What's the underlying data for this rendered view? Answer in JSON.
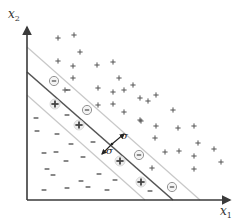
{
  "diagram": {
    "axes": {
      "x_label": "x",
      "x_sub": "1",
      "y_label": "x",
      "y_sub": "2"
    },
    "margin_label": "σ",
    "colors": {
      "axis": "#3a3a3a",
      "boundary": "#555555",
      "margin_line": "#c8c8c8",
      "marker": "#555555",
      "support_circle": "#888888"
    },
    "lines": {
      "upper_margin": {
        "x1": 27,
        "y1": 47,
        "x2": 200,
        "y2": 200
      },
      "boundary": {
        "x1": 27,
        "y1": 72,
        "x2": 173,
        "y2": 200
      },
      "lower_margin": {
        "x1": 27,
        "y1": 95,
        "x2": 145,
        "y2": 200
      }
    },
    "sigma_arrow": {
      "center": [
        112,
        144
      ],
      "upper_tip": [
        124,
        134
      ],
      "lower_tip": [
        102,
        154
      ],
      "label_upper": [
        120,
        138
      ],
      "label_lower": [
        106,
        149
      ]
    },
    "plus_points": [
      [
        58,
        38
      ],
      [
        74,
        35
      ],
      [
        80,
        52
      ],
      [
        58,
        61
      ],
      [
        73,
        66
      ],
      [
        97,
        65
      ],
      [
        113,
        62
      ],
      [
        73,
        78
      ],
      [
        65,
        90
      ],
      [
        98,
        88
      ],
      [
        113,
        92
      ],
      [
        113,
        104
      ],
      [
        119,
        78
      ],
      [
        133,
        85
      ],
      [
        140,
        98
      ],
      [
        148,
        101
      ],
      [
        156,
        95
      ],
      [
        124,
        112
      ],
      [
        173,
        110
      ],
      [
        141,
        121
      ],
      [
        156,
        126
      ],
      [
        178,
        128
      ],
      [
        194,
        126
      ],
      [
        155,
        138
      ],
      [
        165,
        152
      ],
      [
        179,
        151
      ],
      [
        198,
        143
      ],
      [
        214,
        149
      ],
      [
        194,
        156
      ],
      [
        221,
        162
      ],
      [
        194,
        169
      ],
      [
        152,
        168
      ],
      [
        140,
        120
      ],
      [
        124,
        90
      ],
      [
        98,
        105
      ]
    ],
    "minus_points": [
      [
        36,
        118
      ],
      [
        37,
        131
      ],
      [
        57,
        134
      ],
      [
        67,
        115
      ],
      [
        71,
        144
      ],
      [
        44,
        153
      ],
      [
        56,
        152
      ],
      [
        66,
        161
      ],
      [
        83,
        157
      ],
      [
        93,
        142
      ],
      [
        47,
        169
      ],
      [
        53,
        175
      ],
      [
        81,
        181
      ],
      [
        44,
        190
      ],
      [
        67,
        188
      ],
      [
        88,
        187
      ],
      [
        99,
        174
      ],
      [
        115,
        180
      ],
      [
        107,
        190
      ],
      [
        150,
        191
      ],
      [
        68,
        90
      ]
    ],
    "support_minus": [
      [
        54,
        81
      ],
      [
        87,
        110
      ],
      [
        139,
        155
      ],
      [
        172,
        187
      ]
    ],
    "support_plus": [
      [
        55,
        104
      ],
      [
        79,
        125
      ],
      [
        120,
        161
      ],
      [
        141,
        182
      ]
    ]
  }
}
